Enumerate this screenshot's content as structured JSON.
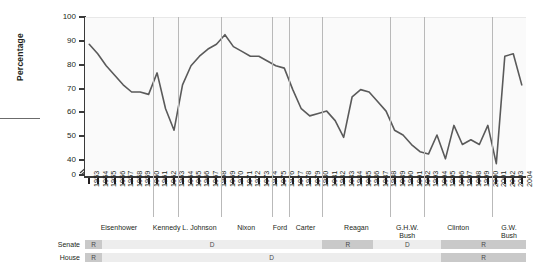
{
  "chart_data": {
    "type": "line",
    "title": "",
    "xlabel": "",
    "ylabel": "Percentage",
    "ylim": [
      0,
      100
    ],
    "yticks": [
      0,
      40,
      50,
      60,
      70,
      80,
      90,
      100
    ],
    "axis_break": true,
    "grid": "vertical-president-terms",
    "line_color": "#5a5a5a",
    "x": [
      1953,
      1954,
      1955,
      1956,
      1957,
      1958,
      1959,
      1960,
      1961,
      1962,
      1963,
      1964,
      1965,
      1966,
      1967,
      1968,
      1969,
      1970,
      1971,
      1972,
      1973,
      1974,
      1975,
      1976,
      1977,
      1978,
      1979,
      1980,
      1981,
      1982,
      1983,
      1984,
      1985,
      1986,
      1987,
      1988,
      1989,
      1990,
      1991,
      1992,
      1993,
      1994,
      1995,
      1996,
      1997,
      1998,
      1999,
      2000,
      2001,
      2002,
      2003,
      2004
    ],
    "values": [
      89,
      85,
      80,
      76,
      72,
      69,
      69,
      68,
      77,
      62,
      53,
      72,
      80,
      84,
      87,
      89,
      93,
      88,
      86,
      84,
      84,
      82,
      80,
      79,
      70,
      62,
      59,
      60,
      61,
      57,
      50,
      67,
      70,
      69,
      65,
      61,
      53,
      51,
      47,
      44,
      43,
      51,
      41,
      55,
      47,
      49,
      47,
      55,
      39,
      84,
      85,
      72
    ],
    "categories": [
      "1953",
      "1954",
      "1955",
      "1956",
      "1957",
      "1958",
      "1959",
      "1960",
      "1961",
      "1962",
      "1963",
      "1964",
      "1965",
      "1966",
      "1967",
      "1968",
      "1969",
      "1970",
      "1971",
      "1972",
      "1973",
      "1974",
      "1975",
      "1976",
      "1977",
      "1978",
      "1979",
      "1980",
      "1981",
      "1982",
      "1983",
      "1984",
      "1985",
      "1986",
      "1987",
      "1988",
      "1989",
      "1990",
      "1991",
      "1992",
      "1993",
      "1994",
      "1995",
      "1996",
      "1997",
      "1998",
      "1999",
      "2000",
      "2001",
      "2002",
      "2003",
      "2004"
    ],
    "presidents": [
      {
        "name": "Eisenhower",
        "start": 1953,
        "end": 1960
      },
      {
        "name": "Kennedy",
        "start": 1961,
        "end": 1963
      },
      {
        "name": "L. Johnson",
        "start": 1964,
        "end": 1968
      },
      {
        "name": "Nixon",
        "start": 1969,
        "end": 1974
      },
      {
        "name": "Ford",
        "start": 1975,
        "end": 1976
      },
      {
        "name": "Carter",
        "start": 1977,
        "end": 1980
      },
      {
        "name": "Reagan",
        "start": 1981,
        "end": 1988
      },
      {
        "name": "G.H.W. Bush",
        "start": 1989,
        "end": 1992
      },
      {
        "name": "Clinton",
        "start": 1993,
        "end": 2000
      },
      {
        "name": "G.W. Bush",
        "start": 2001,
        "end": 2004
      }
    ],
    "congress": [
      {
        "chamber": "Senate",
        "segments": [
          {
            "party": "R",
            "start": 1953,
            "end": 1954
          },
          {
            "party": "D",
            "start": 1955,
            "end": 1980
          },
          {
            "party": "R",
            "start": 1981,
            "end": 1986
          },
          {
            "party": "D",
            "start": 1987,
            "end": 1994
          },
          {
            "party": "R",
            "start": 1995,
            "end": 2004
          }
        ]
      },
      {
        "chamber": "House",
        "segments": [
          {
            "party": "R",
            "start": 1953,
            "end": 1954
          },
          {
            "party": "D",
            "start": 1955,
            "end": 1994
          },
          {
            "party": "R",
            "start": 1995,
            "end": 2004
          }
        ]
      }
    ],
    "colors": {
      "republican_block": "#c9c9c9",
      "democrat_block": "#ededed",
      "plot_background": "#fafafa",
      "gridline": "#b9b9b9",
      "axis": "#3a3a3a"
    }
  },
  "labels": {
    "y_axis_title": "Percentage",
    "senate_row": "Senate",
    "house_row": "House"
  }
}
